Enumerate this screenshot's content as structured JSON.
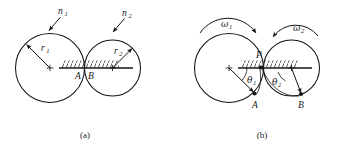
{
  "figure": {
    "background_color": "#ffffff",
    "stroke_color": "#141414",
    "width": 352,
    "height": 147,
    "panels": [
      {
        "id": "a",
        "caption": "(a)",
        "description": "Two externally tangent circles resting on a hatched horizontal surface, with radii labelled and rotation-rate arrows labelled n1 and n2.",
        "labels": {
          "left_speed": "n",
          "left_speed_sub": "1",
          "right_speed": "n",
          "right_speed_sub": "2",
          "left_radius": "r",
          "left_radius_sub": "1",
          "right_radius": "r",
          "right_radius_sub": "2",
          "contact_left": "A",
          "contact_right": "B"
        }
      },
      {
        "id": "b",
        "caption": "(b)",
        "description": "Same two tangent circles with angular velocity arcs omega1 (clockwise arrow to the right) and omega2 (arrow to the left), contact point P, angles theta1 and theta2 measured from the surface to radii reaching points A and B.",
        "labels": {
          "left_omega": "ω",
          "left_omega_sub": "1",
          "right_omega": "ω",
          "right_omega_sub": "2",
          "contact_point": "P",
          "left_angle": "θ",
          "left_angle_sub": "1",
          "right_angle": "θ",
          "right_angle_sub": "2",
          "point_left": "A",
          "point_right": "B"
        }
      }
    ]
  }
}
